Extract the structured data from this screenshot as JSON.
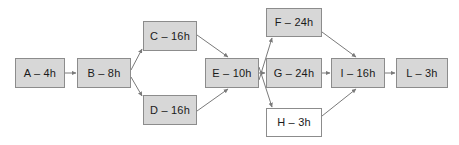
{
  "diagram": {
    "type": "activity-network-diagram",
    "background_color": "#ffffff",
    "node_fill_color": "#d7d7d7",
    "node_fill_color_alt": "#ffffff",
    "node_border_color": "#8c8c8c",
    "edge_color": "#7a7a7a",
    "text_color": "#1a1a1a",
    "nodes": [
      {
        "id": "A",
        "label": "A – 4h",
        "x": 15,
        "y": 58,
        "w": 50,
        "h": 30,
        "fill": "gray"
      },
      {
        "id": "B",
        "label": "B – 8h",
        "x": 77,
        "y": 58,
        "w": 54,
        "h": 30,
        "fill": "gray"
      },
      {
        "id": "C",
        "label": "C – 16h",
        "x": 143,
        "y": 21,
        "w": 54,
        "h": 30,
        "fill": "gray"
      },
      {
        "id": "D",
        "label": "D – 16h",
        "x": 143,
        "y": 95,
        "w": 54,
        "h": 30,
        "fill": "gray"
      },
      {
        "id": "E",
        "label": "E – 10h",
        "x": 205,
        "y": 58,
        "w": 54,
        "h": 30,
        "fill": "gray"
      },
      {
        "id": "F",
        "label": "F – 24h",
        "x": 266,
        "y": 8,
        "w": 56,
        "h": 29,
        "fill": "gray"
      },
      {
        "id": "G",
        "label": "G – 24h",
        "x": 266,
        "y": 58,
        "w": 56,
        "h": 30,
        "fill": "gray"
      },
      {
        "id": "H",
        "label": "H – 3h",
        "x": 266,
        "y": 108,
        "w": 56,
        "h": 29,
        "fill": "white"
      },
      {
        "id": "I",
        "label": "I – 16h",
        "x": 331,
        "y": 58,
        "w": 54,
        "h": 30,
        "fill": "gray"
      },
      {
        "id": "L",
        "label": "L – 3h",
        "x": 396,
        "y": 58,
        "w": 52,
        "h": 30,
        "fill": "gray"
      }
    ],
    "edges": [
      {
        "from": "A",
        "to": "B",
        "x1": 65,
        "y1": 73,
        "x2": 76,
        "y2": 73
      },
      {
        "from": "B",
        "to": "C",
        "x1": 131,
        "y1": 70,
        "x2": 142,
        "y2": 49
      },
      {
        "from": "B",
        "to": "D",
        "x1": 131,
        "y1": 77,
        "x2": 142,
        "y2": 96
      },
      {
        "from": "C",
        "to": "E",
        "x1": 197,
        "y1": 35,
        "x2": 228,
        "y2": 57
      },
      {
        "from": "D",
        "to": "E",
        "x1": 197,
        "y1": 111,
        "x2": 228,
        "y2": 89
      },
      {
        "from": "E",
        "to": "F",
        "x1": 259,
        "y1": 80,
        "x2": 272,
        "y2": 38
      },
      {
        "from": "E",
        "to": "G",
        "x1": 259,
        "y1": 73,
        "x2": 265,
        "y2": 73
      },
      {
        "from": "E",
        "to": "H",
        "x1": 259,
        "y1": 67,
        "x2": 272,
        "y2": 107
      },
      {
        "from": "F",
        "to": "I",
        "x1": 322,
        "y1": 32,
        "x2": 356,
        "y2": 57
      },
      {
        "from": "G",
        "to": "I",
        "x1": 322,
        "y1": 73,
        "x2": 330,
        "y2": 73
      },
      {
        "from": "H",
        "to": "I",
        "x1": 322,
        "y1": 116,
        "x2": 356,
        "y2": 89
      },
      {
        "from": "I",
        "to": "L",
        "x1": 385,
        "y1": 73,
        "x2": 395,
        "y2": 73
      }
    ]
  }
}
